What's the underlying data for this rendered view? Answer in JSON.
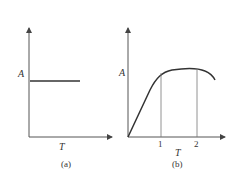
{
  "panels": [
    {
      "id": "a",
      "caption": "(a)",
      "ylabel": "A",
      "xlabel": "T",
      "curve": "constant horizontal line"
    },
    {
      "id": "b",
      "caption": "(b)",
      "ylabel": "A",
      "xlabel": "T",
      "ticks": [
        "1",
        "2"
      ],
      "curve": "linear rise then plateau then slight decline"
    }
  ],
  "colors": {
    "line": "#333333",
    "axis": "#555555",
    "guide": "#777777"
  }
}
